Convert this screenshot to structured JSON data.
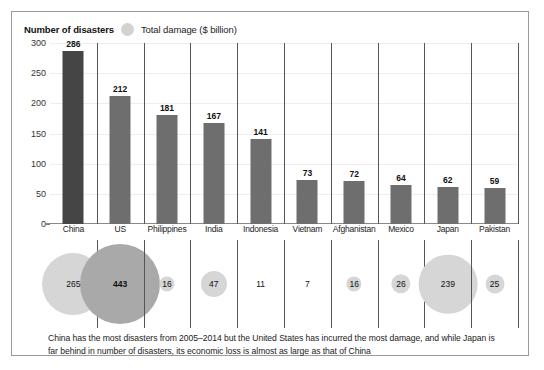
{
  "legend": {
    "bars_label": "Number of disasters",
    "bubbles_label": "Total damage ($ billion)",
    "bubble_icon": "circle-icon"
  },
  "caption": "China has the most disasters from 2005–2014 but the United States has incurred the most damage, and while Japan is far behind in number of disasters, its economic loss is almost as large as that of China",
  "chart_data": {
    "type": "bar",
    "title": "",
    "subtitle": "",
    "xlabel": "",
    "ylabel": "",
    "ylim": [
      0,
      300
    ],
    "yticks": [
      0,
      50,
      100,
      150,
      200,
      250,
      300
    ],
    "grid": true,
    "legend_position": "top-left",
    "categories": [
      "China",
      "US",
      "Philippines",
      "India",
      "Indonesia",
      "Vietnam",
      "Afghanistan",
      "Mexico",
      "Japan",
      "Pakistan"
    ],
    "series": [
      {
        "name": "Number of disasters",
        "type": "bar",
        "values": [
          286,
          212,
          181,
          167,
          141,
          73,
          72,
          64,
          62,
          59
        ],
        "highlight_index": 0
      },
      {
        "name": "Total damage ($ billion)",
        "type": "bubble",
        "values": [
          265,
          443,
          16,
          47,
          11,
          7,
          16,
          26,
          239,
          25
        ],
        "highlight_index": 1
      }
    ]
  },
  "colors": {
    "bar_default": "#6e6e6e",
    "bar_highlight": "#454545",
    "bubble_default": "#d6d6d6",
    "bubble_highlight": "#a9a9a9",
    "frame": "#9a9a9a",
    "axis": "#8a8a8a",
    "gridline": "#eeeeee"
  }
}
